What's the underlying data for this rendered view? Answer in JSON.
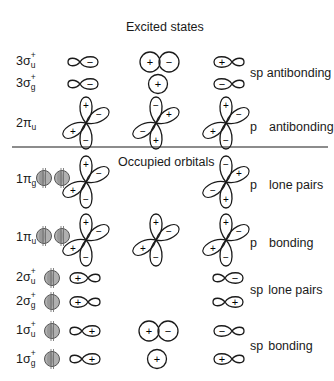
{
  "diagram": {
    "sections": {
      "excited_title": "Excited states",
      "occupied_title": "Occupied orbitals"
    },
    "rows": [
      {
        "id": "3su",
        "num": "3",
        "sym": "σ",
        "sub": "u",
        "sup": "+"
      },
      {
        "id": "3sg",
        "num": "3",
        "sym": "σ",
        "sub": "g",
        "sup": "+"
      },
      {
        "id": "2pu",
        "num": "2",
        "sym": "π",
        "sub": "u",
        "sup": ""
      },
      {
        "id": "1pg",
        "num": "1",
        "sym": "π",
        "sub": "g",
        "sup": ""
      },
      {
        "id": "1pu",
        "num": "1",
        "sym": "π",
        "sub": "u",
        "sup": ""
      },
      {
        "id": "2su",
        "num": "2",
        "sym": "σ",
        "sub": "u",
        "sup": "+"
      },
      {
        "id": "2sg",
        "num": "2",
        "sym": "σ",
        "sub": "g",
        "sup": "+"
      },
      {
        "id": "1su",
        "num": "1",
        "sym": "σ",
        "sub": "u",
        "sup": "+"
      },
      {
        "id": "1sg",
        "num": "1",
        "sym": "σ",
        "sub": "g",
        "sup": "+"
      }
    ],
    "descriptions": {
      "sp_antibonding": "sp antibonding",
      "p_antibonding_p": "p",
      "p_antibonding": "antibonding",
      "p_lone_p": "p",
      "p_lone": "lone pairs",
      "p_bonding_p": "p",
      "p_bonding": "bonding",
      "sp_lone_sp": "sp",
      "sp_lone": "lone pairs",
      "sp_bonding_sp": "sp",
      "sp_bonding": "bonding"
    },
    "signs": {
      "plus": "+",
      "minus": "−"
    },
    "colors": {
      "line": "#1a1a1a",
      "electron_fill": "#a8a8a8",
      "electron_stroke": "#555555"
    }
  }
}
